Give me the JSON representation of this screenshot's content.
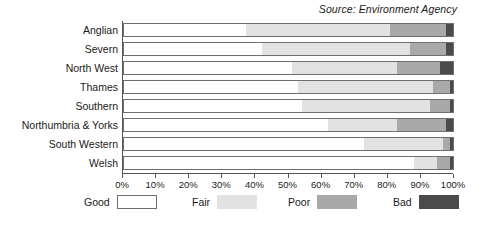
{
  "source_note": "Source: Environment Agency",
  "legend": {
    "position": "bottom",
    "items": [
      {
        "label": "Good",
        "color": "#ffffff",
        "swatch_name": "legend-swatch-good"
      },
      {
        "label": "Fair",
        "color": "#e2e2e2",
        "swatch_name": "legend-swatch-fair"
      },
      {
        "label": "Poor",
        "color": "#a9a9a9",
        "swatch_name": "legend-swatch-poor"
      },
      {
        "label": "Bad",
        "color": "#4b4b4b",
        "swatch_name": "legend-swatch-bad"
      }
    ]
  },
  "chart_data": {
    "type": "bar",
    "orientation": "horizontal",
    "stacked": true,
    "stack_mode": "percent",
    "title": "",
    "subtitle": "",
    "annotations": [
      "Source: Environment Agency"
    ],
    "xlabel": "",
    "ylabel": "",
    "xlim": [
      0,
      100
    ],
    "grid": false,
    "legend_position": "bottom",
    "xticks": [
      0,
      10,
      20,
      30,
      40,
      50,
      60,
      70,
      80,
      90,
      100
    ],
    "xtick_labels": [
      "0%",
      "10%",
      "20%",
      "30%",
      "40%",
      "50%",
      "60%",
      "70%",
      "80%",
      "90%",
      "100%"
    ],
    "categories": [
      "Anglian",
      "Severn",
      "North West",
      "Thames",
      "Southern",
      "Northumbria & Yorks",
      "South Western",
      "Welsh"
    ],
    "series": [
      {
        "name": "Good",
        "color": "#ffffff",
        "values": [
          37,
          42,
          51,
          53,
          54,
          62,
          73,
          88
        ]
      },
      {
        "name": "Fair",
        "color": "#e2e2e2",
        "values": [
          44,
          45,
          32,
          41,
          39,
          21,
          24,
          7
        ]
      },
      {
        "name": "Poor",
        "color": "#a9a9a9",
        "values": [
          17,
          11,
          13,
          5,
          6,
          15,
          2,
          4
        ]
      },
      {
        "name": "Bad",
        "color": "#4b4b4b",
        "values": [
          2,
          2,
          4,
          1,
          1,
          2,
          1,
          1
        ]
      }
    ]
  }
}
